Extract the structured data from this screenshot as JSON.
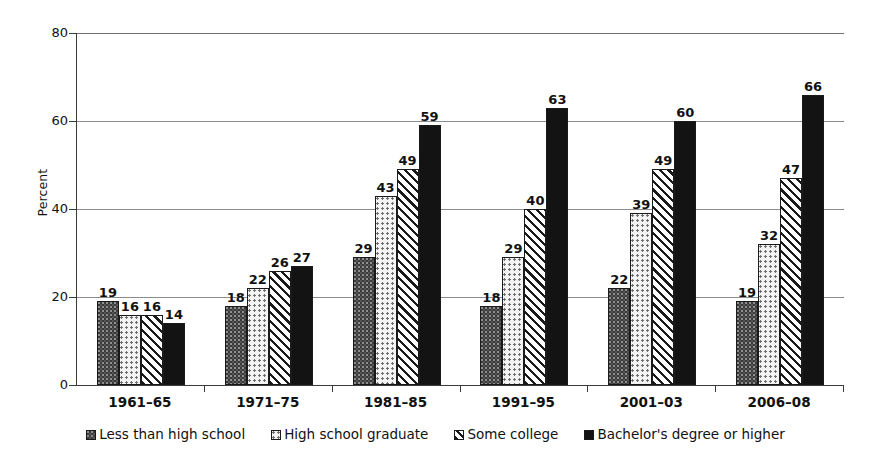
{
  "chart_data": {
    "type": "bar",
    "title": "",
    "xlabel": "",
    "ylabel": "Percent",
    "ylim": [
      0,
      80
    ],
    "yticks": [
      0,
      20,
      40,
      60,
      80
    ],
    "grid": true,
    "legend_position": "bottom",
    "categories": [
      "1961–65",
      "1971–75",
      "1981–85",
      "1991–95",
      "2001–03",
      "2006–08"
    ],
    "series": [
      {
        "name": "Less than high school",
        "pattern": "dark-speckle",
        "color": "#3a3a3a",
        "values": [
          19,
          18,
          29,
          18,
          22,
          19
        ]
      },
      {
        "name": "High school graduate",
        "pattern": "light-dots",
        "color": "#f3f3f3",
        "values": [
          16,
          22,
          43,
          29,
          39,
          32
        ]
      },
      {
        "name": "Some college",
        "pattern": "diagonal-hatch",
        "color": "#ffffff",
        "values": [
          16,
          26,
          49,
          40,
          49,
          47
        ]
      },
      {
        "name": "Bachelor's degree or higher",
        "pattern": "solid-black",
        "color": "#131313",
        "values": [
          14,
          27,
          59,
          63,
          60,
          66
        ]
      }
    ]
  },
  "axes": {
    "y_title": "Percent",
    "y_tick_labels": [
      "0",
      "20",
      "40",
      "60",
      "80"
    ],
    "x_tick_labels": [
      "1961–65",
      "1971–75",
      "1981–85",
      "1991–95",
      "2001–03",
      "2006–08"
    ]
  },
  "legend": {
    "entries": [
      {
        "label": "Less than high school"
      },
      {
        "label": "High school graduate"
      },
      {
        "label": "Some college"
      },
      {
        "label": "Bachelor's degree or higher"
      }
    ]
  }
}
